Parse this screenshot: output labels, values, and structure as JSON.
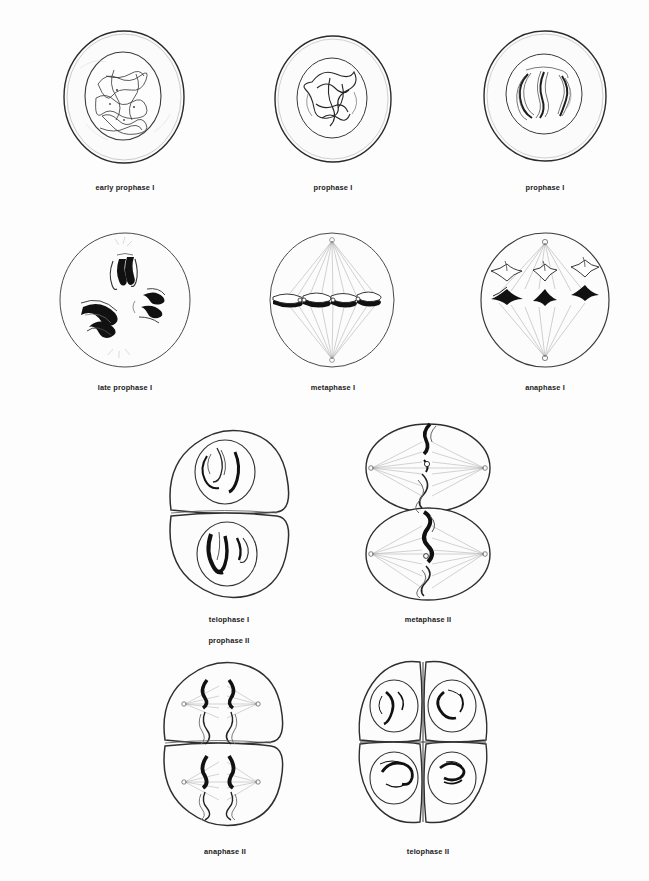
{
  "figure": {
    "background_color": "#fdfdfd",
    "ink_color": "#1a1a1a",
    "panel_count": 10
  },
  "panels": [
    {
      "id": "early-prophase-i",
      "label": "early prophase I",
      "label_lines": [
        "early prophase I"
      ],
      "row": 1,
      "column": 1,
      "cell_shape": "single-round-cell",
      "contents": "nucleus with diffuse tangled chromatin threads",
      "x": 62,
      "y": 28,
      "w": 125,
      "h": 138,
      "caption_x": 35,
      "caption_y": 172
    },
    {
      "id": "prophase-i-a",
      "label": "prophase I",
      "label_lines": [
        "prophase I"
      ],
      "row": 1,
      "column": 2,
      "cell_shape": "single-round-cell",
      "contents": "nucleus with thickening coiled chromosome threads",
      "x": 272,
      "y": 34,
      "w": 122,
      "h": 131,
      "caption_x": 243,
      "caption_y": 172
    },
    {
      "id": "prophase-i-b",
      "label": "prophase I",
      "label_lines": [
        "prophase I"
      ],
      "row": 1,
      "column": 3,
      "cell_shape": "single-round-cell",
      "contents": "nucleus with paired synapsed homologous chromosomes",
      "x": 482,
      "y": 28,
      "w": 127,
      "h": 136,
      "caption_x": 455,
      "caption_y": 172
    },
    {
      "id": "late-prophase-i",
      "label": "late prophase I",
      "label_lines": [
        "late prophase I"
      ],
      "row": 2,
      "column": 1,
      "cell_shape": "single-round-cell",
      "contents": "three bivalent tetrads scattered in cytoplasm, nuclear envelope gone",
      "x": 57,
      "y": 231,
      "w": 136,
      "h": 138,
      "caption_x": 35,
      "caption_y": 372
    },
    {
      "id": "metaphase-i",
      "label": "metaphase I",
      "label_lines": [
        "metaphase I"
      ],
      "row": 2,
      "column": 2,
      "cell_shape": "single-round-cell",
      "contents": "vertical spindle, bivalents aligned on the equatorial plate",
      "x": 267,
      "y": 231,
      "w": 131,
      "h": 138,
      "caption_x": 243,
      "caption_y": 372
    },
    {
      "id": "anaphase-i",
      "label": "anaphase I",
      "label_lines": [
        "anaphase I"
      ],
      "row": 2,
      "column": 3,
      "cell_shape": "single-round-cell",
      "contents": "homologues separating as V shapes toward opposite poles",
      "x": 477,
      "y": 231,
      "w": 136,
      "h": 138,
      "caption_x": 455,
      "caption_y": 372
    },
    {
      "id": "telophase-i-prophase-ii",
      "label": "telophase I / prophase II",
      "label_lines": [
        "telophase I",
        "prophase II"
      ],
      "row": 3,
      "column": 1,
      "cell_shape": "two-stacked-daughter-cells",
      "contents": "two daughter cells, each with a nucleus holding condensed chromosomes",
      "x": 163,
      "y": 424,
      "w": 132,
      "h": 178,
      "caption_x": 139,
      "caption_y": 604
    },
    {
      "id": "metaphase-ii",
      "label": "metaphase II",
      "label_lines": [
        "metaphase II"
      ],
      "row": 3,
      "column": 2,
      "cell_shape": "two-stacked-daughter-cells",
      "contents": "two cells with horizontal spindles, chromosomes on the metaphase plate",
      "x": 360,
      "y": 420,
      "w": 137,
      "h": 184,
      "caption_x": 338,
      "caption_y": 604
    },
    {
      "id": "anaphase-ii",
      "label": "anaphase II",
      "label_lines": [
        "anaphase II"
      ],
      "row": 4,
      "column": 1,
      "cell_shape": "two-stacked-daughter-cells",
      "contents": "sister chromatids pulled apart to the poles in both cells",
      "x": 157,
      "y": 656,
      "w": 135,
      "h": 174,
      "caption_x": 135,
      "caption_y": 836
    },
    {
      "id": "telophase-ii",
      "label": "telophase II",
      "label_lines": [
        "telophase II"
      ],
      "row": 4,
      "column": 2,
      "cell_shape": "four-cell-tetrad",
      "contents": "four haploid daughter cells arranged as a quartet, each with a nucleus",
      "x": 352,
      "y": 656,
      "w": 142,
      "h": 172,
      "caption_x": 338,
      "caption_y": 836
    }
  ]
}
